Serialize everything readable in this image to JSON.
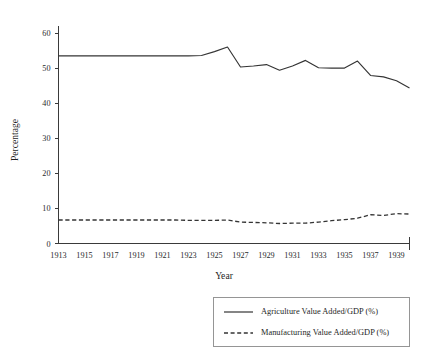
{
  "chart_data": {
    "type": "line",
    "title": "",
    "xlabel": "Year",
    "ylabel": "Percentage",
    "xlim": [
      1913,
      1940
    ],
    "ylim": [
      0,
      62
    ],
    "grid": false,
    "legend_position": "bottom-right",
    "x": [
      1913,
      1914,
      1915,
      1916,
      1917,
      1918,
      1919,
      1920,
      1921,
      1922,
      1923,
      1924,
      1925,
      1926,
      1927,
      1928,
      1929,
      1930,
      1931,
      1932,
      1933,
      1934,
      1935,
      1936,
      1937,
      1938,
      1939,
      1940
    ],
    "xticks": [
      1913,
      1915,
      1917,
      1919,
      1921,
      1923,
      1925,
      1927,
      1929,
      1931,
      1933,
      1935,
      1937,
      1939
    ],
    "xtick_labels": [
      "1913",
      "1915",
      "1917",
      "1919",
      "1921",
      "1923",
      "1925",
      "1927",
      "1929",
      "1931",
      "1933",
      "1935",
      "1937",
      "1939"
    ],
    "yticks": [
      0,
      10,
      20,
      30,
      40,
      50,
      60
    ],
    "ytick_labels": [
      "0",
      "10",
      "20",
      "30",
      "40",
      "50",
      "60"
    ],
    "series": [
      {
        "name": "Agriculture Value Added/GDP (%)",
        "style": "solid",
        "color": "#343434",
        "values": [
          53.5,
          53.5,
          53.5,
          53.5,
          53.5,
          53.5,
          53.5,
          53.5,
          53.5,
          53.5,
          53.5,
          53.6,
          54.7,
          56.0,
          50.3,
          50.6,
          51.0,
          49.4,
          50.6,
          52.2,
          50.1,
          50.0,
          50.0,
          52.0,
          47.9,
          47.5,
          46.4,
          44.3
        ]
      },
      {
        "name": "Manufacturing Value Added/GDP (%)",
        "style": "dashed",
        "color": "#343434",
        "values": [
          6.7,
          6.7,
          6.7,
          6.7,
          6.7,
          6.7,
          6.7,
          6.7,
          6.7,
          6.7,
          6.6,
          6.6,
          6.6,
          6.7,
          6.1,
          6.0,
          5.9,
          5.7,
          5.8,
          5.8,
          6.1,
          6.5,
          6.8,
          7.2,
          8.2,
          8.0,
          8.5,
          8.4
        ]
      }
    ]
  },
  "legend": {
    "entries": [
      {
        "label": "Agriculture Value Added/GDP (%)",
        "style": "solid"
      },
      {
        "label": "Manufacturing Value Added/GDP (%)",
        "style": "dashed"
      }
    ]
  }
}
